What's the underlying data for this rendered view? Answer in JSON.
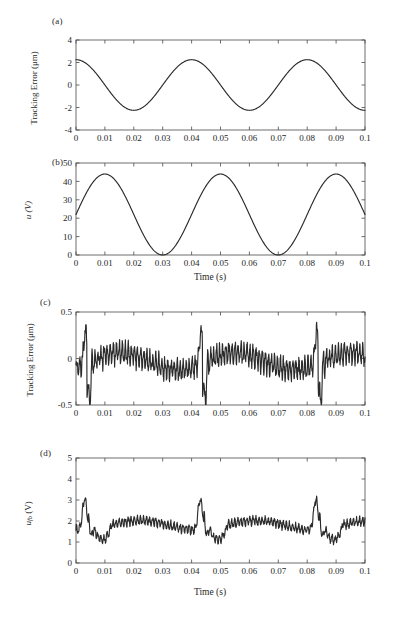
{
  "figure": {
    "background": "#ffffff",
    "line_color": "#2b2b2b",
    "axis_color": "#4a4a4a"
  },
  "panels": [
    {
      "tag": "(a)",
      "ylabel": "Tracking Error (μm)",
      "xlabel": "",
      "yticks": [
        "4",
        "2",
        "0",
        "-2",
        "-4"
      ],
      "xticks": [
        "0",
        "0.01",
        "0.02",
        "0.03",
        "0.04",
        "0.05",
        "0.06",
        "0.07",
        "0.08",
        "0.09",
        "0.1"
      ]
    },
    {
      "tag": "(b)",
      "ylabel": "u (V)",
      "xlabel": "Time (s)",
      "yticks": [
        "50",
        "40",
        "30",
        "20",
        "10",
        "0"
      ],
      "xticks": [
        "0",
        "0.01",
        "0.02",
        "0.03",
        "0.04",
        "0.05",
        "0.06",
        "0.07",
        "0.08",
        "0.09",
        "0.1"
      ]
    },
    {
      "tag": "(c)",
      "ylabel": "Tracking Error (μm)",
      "xlabel": "",
      "yticks": [
        "0.5",
        "0",
        "-0.5"
      ],
      "xticks": [
        "0",
        "0.01",
        "0.02",
        "0.03",
        "0.04",
        "0.05",
        "0.06",
        "0.07",
        "0.08",
        "0.09",
        "0.1"
      ]
    },
    {
      "tag": "(d)",
      "ylabel": "u_fb (V)",
      "xlabel": "Time (s)",
      "yticks": [
        "5",
        "4",
        "3",
        "2",
        "1",
        "0"
      ],
      "xticks": [
        "0",
        "0.01",
        "0.02",
        "0.03",
        "0.04",
        "0.05",
        "0.06",
        "0.07",
        "0.08",
        "0.09",
        "0.1"
      ]
    }
  ],
  "chart_data": [
    {
      "type": "line",
      "panel": "(a)",
      "title": "",
      "xlabel": "",
      "ylabel": "Tracking Error (μm)",
      "xlim": [
        0,
        0.1
      ],
      "ylim": [
        -4,
        4
      ],
      "xticks": [
        0,
        0.01,
        0.02,
        0.03,
        0.04,
        0.05,
        0.06,
        0.07,
        0.08,
        0.09,
        0.1
      ],
      "yticks": [
        -4,
        -2,
        0,
        2,
        4
      ],
      "grid": false,
      "legend": null,
      "description": "Sinusoidal tracking error, amplitude ~2.25 um, period 0.04 s, peaks at t=0.005, 0.045, 0.085 s",
      "model": {
        "form": "amplitude*sin(2*pi*f*t + phase)",
        "amplitude": 2.25,
        "frequency_hz": 25,
        "phase_rad": 1.5708,
        "offset": 0.0
      },
      "x": [
        0,
        0.005,
        0.01,
        0.015,
        0.02,
        0.025,
        0.03,
        0.035,
        0.04,
        0.045,
        0.05,
        0.055,
        0.06,
        0.065,
        0.07,
        0.075,
        0.08,
        0.085,
        0.09,
        0.095,
        0.1
      ],
      "y": [
        1.85,
        2.25,
        1.85,
        0.7,
        -0.7,
        -2.2,
        -2.15,
        -0.75,
        0.7,
        2.25,
        1.85,
        0.7,
        -0.7,
        -2.2,
        -2.15,
        -0.75,
        0.7,
        2.25,
        1.85,
        0.65,
        -1.6
      ]
    },
    {
      "type": "line",
      "panel": "(b)",
      "title": "",
      "xlabel": "Time (s)",
      "ylabel": "u (V)",
      "xlim": [
        0,
        0.1
      ],
      "ylim": [
        0,
        50
      ],
      "xticks": [
        0,
        0.01,
        0.02,
        0.03,
        0.04,
        0.05,
        0.06,
        0.07,
        0.08,
        0.09,
        0.1
      ],
      "yticks": [
        0,
        10,
        20,
        30,
        40,
        50
      ],
      "grid": false,
      "legend": null,
      "description": "Sinusoidal control voltage, 0 to 44 V, period 0.04 s, peaks at t=0.015, 0.055, 0.095 s, minima at t=0.035, 0.075 s",
      "model": {
        "form": "mid + amplitude*sin(2*pi*f*t + phase)",
        "mid": 22,
        "amplitude": 22,
        "frequency_hz": 25,
        "phase_rad": 0.0,
        "offset": 0.0
      },
      "x": [
        0,
        0.005,
        0.01,
        0.015,
        0.02,
        0.025,
        0.03,
        0.035,
        0.04,
        0.045,
        0.05,
        0.055,
        0.06,
        0.065,
        0.07,
        0.075,
        0.08,
        0.085,
        0.09,
        0.095,
        0.1
      ],
      "y": [
        8.5,
        22,
        37,
        43.8,
        37,
        22,
        7,
        0.2,
        7,
        22,
        37,
        43.8,
        37,
        22,
        7,
        0.2,
        7,
        22,
        37,
        43.8,
        35
      ]
    },
    {
      "type": "line",
      "panel": "(c)",
      "title": "",
      "xlabel": "",
      "ylabel": "Tracking Error (μm)",
      "xlim": [
        0,
        0.1
      ],
      "ylim": [
        -0.5,
        0.5
      ],
      "xticks": [
        0,
        0.01,
        0.02,
        0.03,
        0.04,
        0.05,
        0.06,
        0.07,
        0.08,
        0.09,
        0.1
      ],
      "yticks": [
        -0.5,
        0,
        0.5
      ],
      "grid": false,
      "legend": null,
      "description": "Noisy residual tracking error with high-frequency ripple and three large transients at t~0.003, 0.043, 0.083 s reaching +0.43 then dropping to -0.38",
      "model": {
        "form": "ripple + envelope + transients",
        "ripple_amplitude": 0.09,
        "ripple_frequency_hz": 950,
        "envelope_amplitude": 0.09,
        "envelope_frequency_hz": 25,
        "noise_amplitude": 0.045,
        "transient_times": [
          0.003,
          0.043,
          0.083
        ],
        "transient_peak": 0.43,
        "transient_trough": -0.38,
        "baseline": -0.03
      },
      "summary_points": {
        "x": [
          0,
          0.003,
          0.0045,
          0.01,
          0.015,
          0.02,
          0.025,
          0.03,
          0.035,
          0.04,
          0.043,
          0.0445,
          0.05,
          0.055,
          0.06,
          0.065,
          0.07,
          0.075,
          0.08,
          0.083,
          0.0845,
          0.09,
          0.095,
          0.1
        ],
        "y": [
          0.02,
          0.41,
          -0.38,
          -0.13,
          0.22,
          0.12,
          0.23,
          0.05,
          0.04,
          0.06,
          0.43,
          -0.38,
          -0.14,
          0.18,
          0.12,
          0.21,
          0.05,
          0.08,
          0.05,
          0.42,
          -0.38,
          -0.12,
          0.18,
          -0.16
        ]
      }
    },
    {
      "type": "line",
      "panel": "(d)",
      "title": "",
      "xlabel": "Time (s)",
      "ylabel": "u_fb (V)",
      "xlim": [
        0,
        0.1
      ],
      "ylim": [
        0,
        5
      ],
      "xticks": [
        0,
        0.01,
        0.02,
        0.03,
        0.04,
        0.05,
        0.06,
        0.07,
        0.08,
        0.09,
        0.1
      ],
      "yticks": [
        0,
        1,
        2,
        3,
        4,
        5
      ],
      "grid": false,
      "legend": null,
      "description": "Feedback control voltage, noisy baseline near 1.8 V with three peaks reaching 3.4 V at t~0.003, 0.043, 0.083 s",
      "model": {
        "form": "baseline + ripple + peaks",
        "baseline": 1.8,
        "ripple_amplitude": 0.16,
        "ripple_frequency_hz": 950,
        "envelope_amplitude": 0.22,
        "envelope_frequency_hz": 25,
        "noise_amplitude": 0.09,
        "peak_times": [
          0.003,
          0.043,
          0.083
        ],
        "peak_value": 3.4,
        "trough_value": 1.15
      },
      "summary_points": {
        "x": [
          0,
          0.003,
          0.006,
          0.011,
          0.015,
          0.02,
          0.025,
          0.03,
          0.035,
          0.04,
          0.043,
          0.047,
          0.051,
          0.055,
          0.06,
          0.065,
          0.07,
          0.075,
          0.08,
          0.083,
          0.087,
          0.091,
          0.095,
          0.1
        ],
        "y": [
          2.15,
          3.4,
          2.25,
          1.2,
          1.75,
          1.95,
          2.3,
          1.8,
          1.75,
          2.1,
          3.4,
          2.0,
          1.2,
          1.7,
          1.9,
          2.3,
          1.75,
          1.8,
          2.05,
          3.4,
          2.0,
          1.15,
          1.7,
          2.0
        ]
      }
    }
  ]
}
